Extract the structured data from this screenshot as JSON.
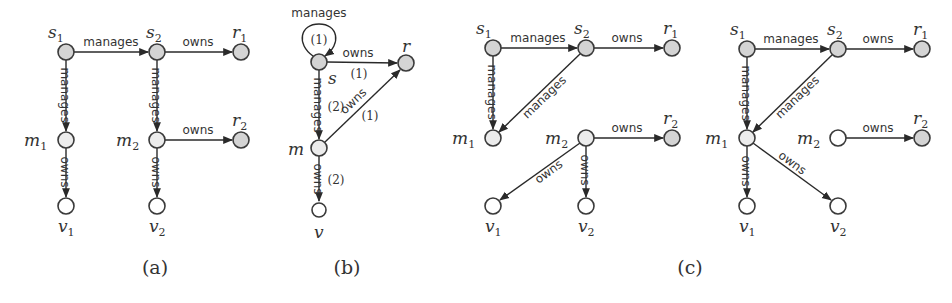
{
  "colors": {
    "subject_resource_fill": "#d4d4d4",
    "manager_fill": "#ececec",
    "vertex_fill": "#ffffff",
    "stroke": "#3a3a3a"
  },
  "edge_labels": {
    "manages": "manages",
    "owns": "owns"
  },
  "diagrams": {
    "a": {
      "caption": "(a)",
      "nodes": [
        {
          "id": "s1",
          "base": "s",
          "sub": "1",
          "x": 66,
          "y": 52,
          "type": "sr"
        },
        {
          "id": "s2",
          "base": "s",
          "sub": "2",
          "x": 157,
          "y": 52,
          "type": "sr"
        },
        {
          "id": "r1",
          "base": "r",
          "sub": "1",
          "x": 241,
          "y": 52,
          "type": "sr"
        },
        {
          "id": "m1",
          "base": "m",
          "sub": "1",
          "x": 66,
          "y": 140,
          "type": "m"
        },
        {
          "id": "m2",
          "base": "m",
          "sub": "2",
          "x": 157,
          "y": 140,
          "type": "m"
        },
        {
          "id": "r2",
          "base": "r",
          "sub": "2",
          "x": 241,
          "y": 140,
          "type": "sr"
        },
        {
          "id": "v1",
          "base": "v",
          "sub": "1",
          "x": 66,
          "y": 206,
          "type": "v"
        },
        {
          "id": "v2",
          "base": "v",
          "sub": "2",
          "x": 157,
          "y": 206,
          "type": "v"
        }
      ],
      "edges": [
        {
          "from": "s1",
          "to": "s2",
          "label": "manages"
        },
        {
          "from": "s2",
          "to": "r1",
          "label": "owns"
        },
        {
          "from": "s1",
          "to": "m1",
          "label": "manages"
        },
        {
          "from": "s2",
          "to": "m2",
          "label": "manages"
        },
        {
          "from": "m2",
          "to": "r2",
          "label": "owns"
        },
        {
          "from": "m1",
          "to": "v1",
          "label": "owns"
        },
        {
          "from": "m2",
          "to": "v2",
          "label": "owns"
        }
      ]
    },
    "b": {
      "caption": "(b)",
      "nodes": [
        {
          "id": "s",
          "base": "s",
          "x": 319,
          "y": 62,
          "type": "sr"
        },
        {
          "id": "r",
          "base": "r",
          "x": 406,
          "y": 63,
          "type": "sr"
        },
        {
          "id": "m",
          "base": "m",
          "x": 319,
          "y": 148,
          "type": "m"
        },
        {
          "id": "v",
          "base": "v",
          "x": 319,
          "y": 210,
          "type": "v"
        }
      ],
      "edges": [
        {
          "from": "s",
          "to": "s",
          "label": "manages",
          "multiplicity": "(1)"
        },
        {
          "from": "s",
          "to": "r",
          "label": "owns",
          "multiplicity": "(1)"
        },
        {
          "from": "s",
          "to": "m",
          "label": "manages",
          "multiplicity": "(2)"
        },
        {
          "from": "m",
          "to": "r",
          "label": "owns",
          "multiplicity": "(1)"
        },
        {
          "from": "m",
          "to": "v",
          "label": "owns",
          "multiplicity": "(2)"
        }
      ]
    },
    "c1": {
      "nodes": [
        {
          "id": "s1",
          "base": "s",
          "sub": "1",
          "x": 493,
          "y": 48,
          "type": "sr"
        },
        {
          "id": "s2",
          "base": "s",
          "sub": "2",
          "x": 586,
          "y": 48,
          "type": "sr"
        },
        {
          "id": "r1",
          "base": "r",
          "sub": "1",
          "x": 672,
          "y": 48,
          "type": "sr"
        },
        {
          "id": "m1",
          "base": "m",
          "sub": "1",
          "x": 493,
          "y": 138,
          "type": "m"
        },
        {
          "id": "m2",
          "base": "m",
          "sub": "2",
          "x": 586,
          "y": 138,
          "type": "m"
        },
        {
          "id": "r2",
          "base": "r",
          "sub": "2",
          "x": 672,
          "y": 138,
          "type": "sr"
        },
        {
          "id": "v1",
          "base": "v",
          "sub": "1",
          "x": 493,
          "y": 206,
          "type": "v"
        },
        {
          "id": "v2",
          "base": "v",
          "sub": "2",
          "x": 586,
          "y": 206,
          "type": "v"
        }
      ],
      "edges": [
        {
          "from": "s1",
          "to": "s2",
          "label": "manages"
        },
        {
          "from": "s2",
          "to": "r1",
          "label": "owns"
        },
        {
          "from": "s1",
          "to": "m1",
          "label": "manages"
        },
        {
          "from": "s2",
          "to": "m1",
          "label": "manages"
        },
        {
          "from": "m2",
          "to": "r2",
          "label": "owns"
        },
        {
          "from": "m2",
          "to": "v1",
          "label": "owns"
        },
        {
          "from": "m2",
          "to": "v2",
          "label": "owns"
        }
      ]
    },
    "c2": {
      "nodes": [
        {
          "id": "s1",
          "base": "s",
          "sub": "1",
          "x": 747,
          "y": 49,
          "type": "sr"
        },
        {
          "id": "s2",
          "base": "s",
          "sub": "2",
          "x": 838,
          "y": 49,
          "type": "sr"
        },
        {
          "id": "r1",
          "base": "r",
          "sub": "1",
          "x": 922,
          "y": 49,
          "type": "sr"
        },
        {
          "id": "m1",
          "base": "m",
          "sub": "1",
          "x": 747,
          "y": 138,
          "type": "m"
        },
        {
          "id": "m2",
          "base": "m",
          "sub": "2",
          "x": 838,
          "y": 138,
          "type": "v"
        },
        {
          "id": "r2",
          "base": "r",
          "sub": "2",
          "x": 922,
          "y": 138,
          "type": "sr"
        },
        {
          "id": "v1",
          "base": "v",
          "sub": "1",
          "x": 747,
          "y": 206,
          "type": "v"
        },
        {
          "id": "v2",
          "base": "v",
          "sub": "2",
          "x": 838,
          "y": 206,
          "type": "v"
        }
      ],
      "edges": [
        {
          "from": "s1",
          "to": "s2",
          "label": "manages"
        },
        {
          "from": "s2",
          "to": "r1",
          "label": "owns"
        },
        {
          "from": "s1",
          "to": "m1",
          "label": "manages"
        },
        {
          "from": "s2",
          "to": "m1",
          "label": "manages"
        },
        {
          "from": "m2",
          "to": "r2",
          "label": "owns"
        },
        {
          "from": "m1",
          "to": "v1",
          "label": "owns"
        },
        {
          "from": "m1",
          "to": "v2",
          "label": "owns"
        }
      ]
    },
    "c_caption": "(c)"
  }
}
